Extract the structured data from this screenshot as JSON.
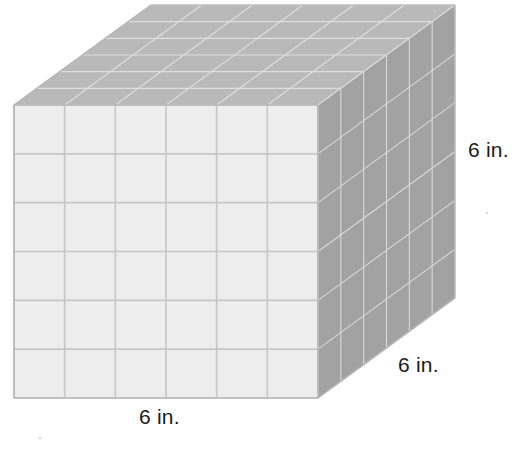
{
  "figure": {
    "name": "unit-cube-solid",
    "shape": "cube",
    "unit_cubes_per_edge": 6,
    "front_face_grid": {
      "columns": 6,
      "rows": 6
    },
    "top_face_grid": {
      "columns": 6,
      "rows": 6
    },
    "right_face_grid": {
      "columns": 6,
      "rows": 6
    },
    "colors": {
      "front_face": "#ededed",
      "front_grid_line": "#c6c6c6",
      "top_face": "#b9b9b9",
      "top_grid_line": "#dedede",
      "right_face": "#a2a2a2",
      "right_grid_line": "#d9d9d9",
      "outline": "#b0b0b0",
      "label_text": "#1b1b1b",
      "background": "#ffffff"
    },
    "geometry": {
      "front_left_x": 14,
      "front_right_x": 318,
      "front_top_y": 105,
      "front_bottom_y": 398,
      "depth_dx": 137,
      "depth_dy": -100
    }
  },
  "labels": {
    "width": "6 in.",
    "depth": "6 in.",
    "height": "6 in."
  }
}
